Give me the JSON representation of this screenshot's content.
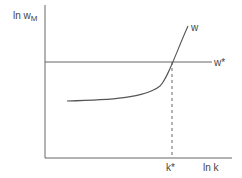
{
  "diagram": {
    "y_axis_label": "ln w",
    "y_axis_label_sub": "M",
    "x_axis_label": "ln k",
    "curve_label": "w",
    "horizontal_line_label": "w*",
    "intersection_tick_label": "k*",
    "line_color": "#555555",
    "elements": [
      {
        "type": "axis",
        "name": "vertical axis",
        "label": "ln wM"
      },
      {
        "type": "axis",
        "name": "horizontal axis",
        "label": "ln k"
      },
      {
        "type": "horizontal line",
        "label": "w*"
      },
      {
        "type": "convex increasing curve",
        "label": "w"
      },
      {
        "type": "dashed vertical line",
        "from": "intersection of w and w*",
        "to": "horizontal axis",
        "label": "k*"
      }
    ]
  }
}
